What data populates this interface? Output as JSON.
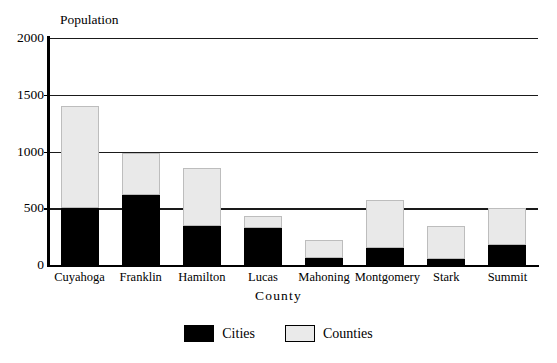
{
  "chart_data": {
    "type": "bar",
    "stacked": true,
    "title": "",
    "xlabel": "County",
    "ylabel": "Population",
    "categories": [
      "Cuyahoga",
      "Franklin",
      "Hamilton",
      "Lucas",
      "Mahoning",
      "Montgomery",
      "Stark",
      "Summit"
    ],
    "series": [
      {
        "name": "Cities",
        "color": "#000000",
        "values": [
          500,
          620,
          345,
          330,
          60,
          150,
          55,
          180
        ]
      },
      {
        "name": "Counties",
        "color": "#eaeaea",
        "values": [
          900,
          365,
          510,
          100,
          160,
          420,
          285,
          325
        ]
      }
    ],
    "totals": [
      1400,
      985,
      855,
      430,
      220,
      570,
      340,
      505
    ],
    "ylim": [
      0,
      2000
    ],
    "yticks": [
      0,
      500,
      1000,
      1500,
      2000
    ],
    "grid": true,
    "legend_position": "bottom"
  },
  "legend": {
    "items": [
      {
        "label": "Cities"
      },
      {
        "label": "Counties"
      }
    ]
  }
}
